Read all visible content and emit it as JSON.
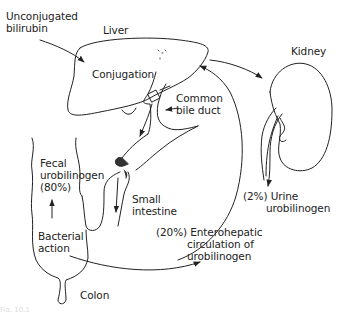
{
  "diagram": {
    "type": "physiology-flow",
    "labels": {
      "unconjugated_bilirubin": [
        "Unconjugated",
        "bilirubin"
      ],
      "liver": "Liver",
      "conjugation": "Conjugation",
      "common_bile_duct": [
        "Common",
        "bile duct"
      ],
      "kidney": "Kidney",
      "fecal_urobilinogen": [
        "Fecal",
        "urobilinogen",
        "(80%)"
      ],
      "small_intestine": [
        "Small",
        "intestine"
      ],
      "bacterial_action": [
        "Bacterial",
        "action"
      ],
      "enterohepatic": [
        "(20%) Enterohepatic",
        "circulation of",
        "urobilinogen"
      ],
      "urine_urobilinogen": [
        "(2%) Urine",
        "urobilinogen"
      ],
      "colon": "Colon",
      "caption": "Fig. 10.1"
    },
    "flows": [
      {
        "from": "Unconjugated bilirubin",
        "to": "Liver"
      },
      {
        "from": "Liver",
        "to": "Common bile duct"
      },
      {
        "from": "Common bile duct",
        "to": "Small intestine"
      },
      {
        "from": "Small intestine",
        "to": "Colon",
        "process": "Bacterial action"
      },
      {
        "from": "Colon",
        "to": "Fecal urobilinogen",
        "percent": 80
      },
      {
        "from": "Colon",
        "to": "Liver",
        "via": "Enterohepatic circulation",
        "percent": 20
      },
      {
        "from": "Liver",
        "to": "Kidney"
      },
      {
        "from": "Kidney",
        "to": "Urine urobilinogen",
        "percent": 2
      }
    ],
    "colors": {
      "line": "#222222",
      "background": "#ffffff"
    }
  }
}
